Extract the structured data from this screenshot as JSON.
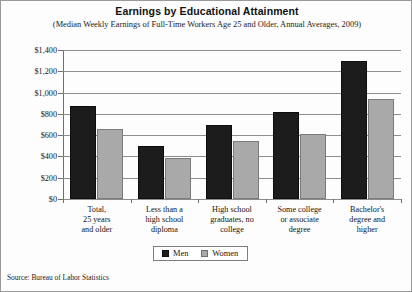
{
  "chart_data": {
    "type": "bar",
    "title": "Earnings by Educational Attainment",
    "subtitle": "(Median Weekly Earnings of Full-Time Workers Age 25 and Older, Annual Averages, 2009)",
    "xlabel": "",
    "ylabel": "",
    "ylim": [
      0,
      1400
    ],
    "ytick_values": [
      0,
      200,
      400,
      600,
      800,
      1000,
      1200,
      1400
    ],
    "ytick_labels": [
      "$0",
      "$200",
      "$400",
      "$600",
      "$800",
      "$1,000",
      "$1,200",
      "$1,400"
    ],
    "grid": true,
    "legend_position": "bottom-center",
    "categories": [
      "Total,\n25 years\nand older",
      "Less than a\nhigh school\ndiploma",
      "High school\ngraduates, no\ncollege",
      "Some college\nor associate\ndegree",
      "Bachelor's\ndegree and\nhigher"
    ],
    "category_lines": [
      [
        "Total,",
        "25 years",
        "and older"
      ],
      [
        "Less than a",
        "high school",
        "diploma"
      ],
      [
        "High school",
        "graduates, no",
        "college"
      ],
      [
        "Some college",
        "or associate",
        "degree"
      ],
      [
        "Bachelor's",
        "degree and",
        "higher"
      ]
    ],
    "series": [
      {
        "name": "Men",
        "color": "#1c1c1c",
        "values": [
          870,
          500,
          700,
          820,
          1300
        ]
      },
      {
        "name": "Women",
        "color": "#a9a9a9",
        "values": [
          660,
          390,
          545,
          610,
          940
        ]
      }
    ]
  },
  "source": "Source: Bureau of Labor Statistics"
}
